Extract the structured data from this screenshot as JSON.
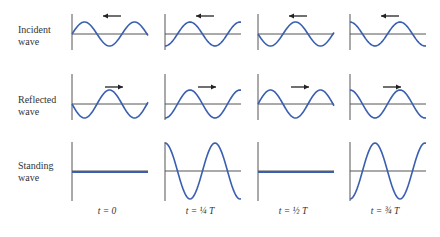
{
  "rows": [
    {
      "label_line1": "Incident",
      "label_line2": "wave",
      "direction": "left"
    },
    {
      "label_line1": "Reflected",
      "label_line2": "wave",
      "direction": "right"
    },
    {
      "label_line1": "Standing",
      "label_line2": "wave"
    }
  ],
  "columns": [
    {
      "time_label": "t = 0"
    },
    {
      "time_label": "t = ¼ T"
    },
    {
      "time_label": "t = ½ T"
    },
    {
      "time_label": "t = ¾ T"
    }
  ],
  "colors": {
    "wave": "#3a5fb0",
    "axis": "#555555",
    "arrow": "#222222"
  }
}
